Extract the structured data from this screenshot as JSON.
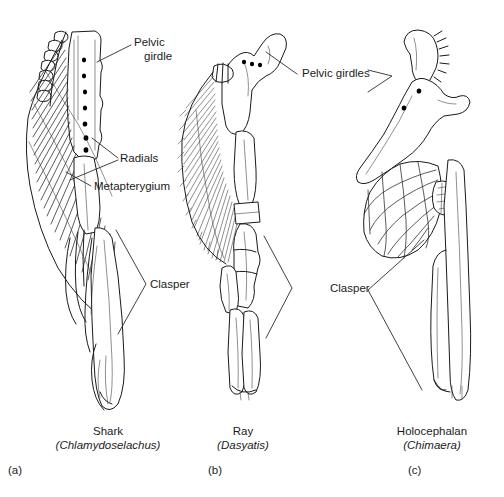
{
  "figure": {
    "background_color": "#ffffff",
    "ink_color": "#1a1a1a",
    "width": 504,
    "height": 497
  },
  "annotations": {
    "pelvic_girdle": {
      "line1": "Pelvic",
      "line2": "girdle"
    },
    "radials": "Radials",
    "metapterygium": "Metapterygium",
    "pelvic_girdles": "Pelvic girdles",
    "clasper_left": "Clasper",
    "clasper_right": "Clasper"
  },
  "panels": [
    {
      "id": "a",
      "panel_label": "(a)",
      "common_name": "Shark",
      "genus": "(Chlamydoselachus)"
    },
    {
      "id": "b",
      "panel_label": "(b)",
      "common_name": "Ray",
      "genus": "(Dasyatis)"
    },
    {
      "id": "c",
      "panel_label": "(c)",
      "common_name": "Holocephalan",
      "genus": "(Chimaera)"
    }
  ]
}
